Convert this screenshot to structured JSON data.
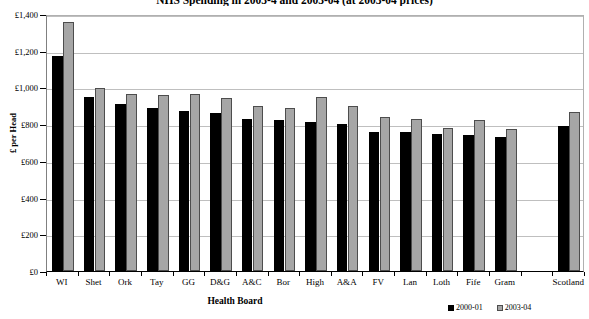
{
  "chart_data": {
    "type": "bar",
    "title": "NHS Spending in 2003-4 and 2003-04 (at 2003-04 prices)",
    "xlabel": "Health Board",
    "ylabel": "£ per Head",
    "ylim": [
      0,
      1400
    ],
    "ytick_step": 200,
    "ytick_labels": [
      "£0",
      "£200",
      "£400",
      "£600",
      "£800",
      "£1,000",
      "£1,200",
      "£1,400"
    ],
    "ytick_values": [
      0,
      200,
      400,
      600,
      800,
      1000,
      1200,
      1400
    ],
    "grid": true,
    "legend_position": "bottom-right",
    "categories": [
      "WI",
      "Shet",
      "Ork",
      "Tay",
      "GG",
      "D&G",
      "A&C",
      "Bor",
      "High",
      "A&A",
      "FV",
      "Lan",
      "Loth",
      "Fife",
      "Gram",
      "",
      "Scotland"
    ],
    "series": [
      {
        "name": "2000-01",
        "color": "#000000",
        "values": [
          1170,
          950,
          910,
          890,
          870,
          860,
          830,
          825,
          810,
          800,
          760,
          755,
          745,
          740,
          730,
          null,
          790
        ]
      },
      {
        "name": "2003-04",
        "color": "#a6a6a6",
        "values": [
          1355,
          995,
          965,
          960,
          965,
          945,
          900,
          890,
          950,
          900,
          840,
          830,
          780,
          825,
          775,
          null,
          865
        ]
      }
    ]
  },
  "axis": {
    "y_title": "£ per Head",
    "x_title": "Health Board"
  },
  "legend": {
    "items": [
      {
        "label": "2000-01",
        "color": "#000000"
      },
      {
        "label": "2003-04",
        "color": "#a6a6a6"
      }
    ]
  }
}
